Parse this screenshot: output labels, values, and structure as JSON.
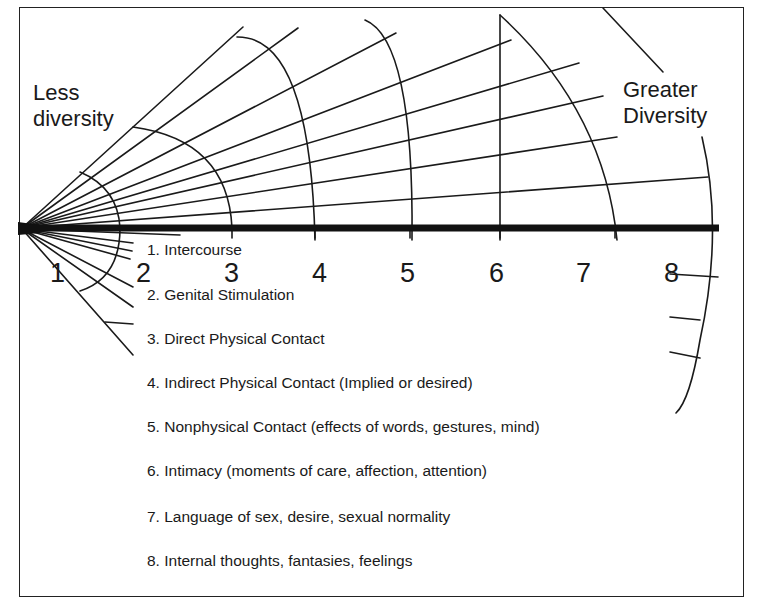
{
  "diagram": {
    "left_label": [
      "Less",
      "diversity"
    ],
    "right_label": [
      "Greater",
      "Diversity"
    ],
    "scale_numbers": [
      "1",
      "2",
      "3",
      "4",
      "5",
      "6",
      "7",
      "8"
    ],
    "legend": [
      "1. Intercourse",
      "2. Genital Stimulation",
      "3. Direct Physical Contact",
      "4. Indirect Physical Contact (Implied or desired)",
      "5. Nonphysical Contact (effects of words, gestures, mind)",
      "6. Intimacy (moments of care, affection, attention)",
      "7. Language of sex, desire, sexual normality",
      "8. Internal thoughts, fantasies, feelings"
    ],
    "colors": {
      "line": "#1a1a1a",
      "background": "#ffffff"
    }
  }
}
